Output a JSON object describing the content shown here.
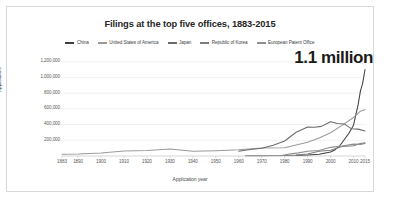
{
  "chart_data": {
    "type": "line",
    "title": "Filings at the top five offices, 1883-2015",
    "xlabel": "Application year",
    "ylabel": "Applications",
    "xlim": [
      1883,
      2015
    ],
    "ylim": [
      0,
      1260000
    ],
    "grid": true,
    "legend_position": "top-center",
    "xticks": [
      "1883",
      "1890",
      "1900",
      "1910",
      "1920",
      "1930",
      "1940",
      "1950",
      "1960",
      "1970",
      "1980",
      "1990",
      "2000",
      "2010",
      "2015"
    ],
    "xtick_values": [
      1883,
      1890,
      1900,
      1910,
      1920,
      1930,
      1940,
      1950,
      1960,
      1970,
      1980,
      1990,
      2000,
      2010,
      2015
    ],
    "yticks": [
      "200,000",
      "400,000",
      "600,000",
      "800,000",
      "1,000,000",
      "1,200,000"
    ],
    "ytick_values": [
      200000,
      400000,
      600000,
      800000,
      1000000,
      1200000
    ],
    "annotations": [
      {
        "text": "1.1 million",
        "x": 2014,
        "y": 1100000
      }
    ],
    "series": [
      {
        "name": "China",
        "color": "#3f3f3f",
        "x": [
          1985,
          1990,
          1995,
          2000,
          2002,
          2004,
          2006,
          2008,
          2010,
          2011,
          2012,
          2013,
          2014,
          2015
        ],
        "values": [
          9000,
          12000,
          22000,
          52000,
          80000,
          130000,
          210000,
          290000,
          391000,
          526000,
          652000,
          825000,
          928000,
          1101000
        ]
      },
      {
        "name": "United States of America",
        "color": "#9a9a9a",
        "x": [
          1883,
          1890,
          1900,
          1910,
          1920,
          1930,
          1940,
          1950,
          1960,
          1970,
          1980,
          1990,
          1995,
          2000,
          2005,
          2010,
          2013,
          2015
        ],
        "values": [
          22000,
          26000,
          39000,
          63000,
          69000,
          89000,
          61000,
          67000,
          79000,
          102000,
          104000,
          176000,
          228000,
          296000,
          390000,
          490000,
          571000,
          589000
        ]
      },
      {
        "name": "Japan",
        "color": "#6b6b6b",
        "x": [
          1960,
          1965,
          1970,
          1975,
          1980,
          1985,
          1990,
          1993,
          1996,
          2000,
          2003,
          2006,
          2009,
          2012,
          2015
        ],
        "values": [
          60000,
          82000,
          99000,
          136000,
          191000,
          302000,
          368000,
          366000,
          377000,
          436000,
          413000,
          408000,
          348000,
          342000,
          319000
        ]
      },
      {
        "name": "Republic of Korea",
        "color": "#7d7d7d",
        "x": [
          1963,
          1970,
          1980,
          1985,
          1990,
          1995,
          2000,
          2005,
          2010,
          2013,
          2015
        ],
        "values": [
          2000,
          3000,
          6000,
          11000,
          25000,
          60000,
          72000,
          122000,
          131000,
          159000,
          167000
        ]
      },
      {
        "name": "European Patent Office",
        "color": "#8e8e8e",
        "x": [
          1978,
          1982,
          1986,
          1990,
          1995,
          2000,
          2005,
          2010,
          2013,
          2015
        ],
        "values": [
          3500,
          26000,
          40000,
          61000,
          69000,
          110000,
          128000,
          151000,
          148000,
          160000
        ]
      }
    ]
  },
  "legend": {
    "items": [
      {
        "label": "China"
      },
      {
        "label": "United States of America"
      },
      {
        "label": "Japan"
      },
      {
        "label": "Republic of Korea"
      },
      {
        "label": "European Patent Office"
      }
    ]
  }
}
